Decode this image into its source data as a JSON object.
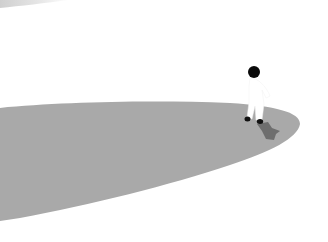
{
  "scene": {
    "background_color": "#ffffff",
    "platform_color": "#a9a9a9",
    "shadow_color": "#6e6e6e",
    "character": {
      "head_color": "#0a0a0a",
      "body_color": "#ffffff",
      "feet_color": "#111111"
    },
    "top_smudge_color": "#d8d8d8"
  }
}
